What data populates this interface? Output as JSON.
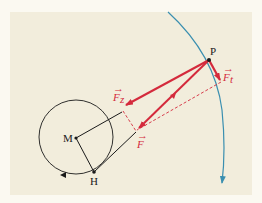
{
  "diagram": {
    "type": "physics-force-decomposition",
    "colors": {
      "background": "#f2eddc",
      "border": "#fbf9f1",
      "force": "#d42a3c",
      "trajectory": "#3a8fb0",
      "construction": "#1a1a1a"
    },
    "points": {
      "P": {
        "label": "P",
        "x": 209,
        "y": 60
      },
      "M": {
        "label": "M",
        "x": 76,
        "y": 138
      },
      "H": {
        "label": "H",
        "x": 94,
        "y": 172
      }
    },
    "vectors": {
      "F": {
        "label": "F",
        "arrow": "→"
      },
      "Fz": {
        "label": "F",
        "subscript": "z",
        "arrow": "→"
      },
      "Ft": {
        "label": "F",
        "subscript": "t",
        "arrow": "→"
      }
    },
    "circle": {
      "center": "M",
      "radius": 37,
      "direction_marker": "arrowhead"
    },
    "trajectory": {
      "description": "blue arc through P with arrow pointing down"
    }
  }
}
